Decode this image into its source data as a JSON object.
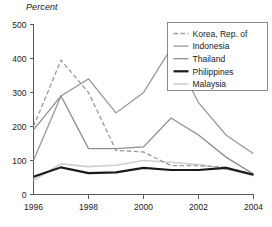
{
  "chart_data": {
    "type": "line",
    "title": "",
    "ylabel": "Percent",
    "xlabel": "",
    "ylim": [
      0,
      500
    ],
    "xlim": [
      1996,
      2004
    ],
    "yticks": [
      0,
      100,
      200,
      300,
      400,
      500
    ],
    "xticks": [
      1996,
      1998,
      2000,
      2002,
      2004
    ],
    "ytick_labels": [
      "0",
      "100",
      "200",
      "300",
      "400",
      "500"
    ],
    "xtick_labels": [
      "1996",
      "1998",
      "2000",
      "2002",
      "2004"
    ],
    "grid": false,
    "legend_position": "top-right",
    "x": [
      1996,
      1997,
      1998,
      1999,
      2000,
      2001,
      2002,
      2003,
      2004
    ],
    "series": [
      {
        "name": "Korea, Rep. of",
        "style": "dashed",
        "color": "#9a9a9a",
        "width": 1.3,
        "values": [
          200,
          395,
          300,
          130,
          125,
          85,
          85,
          80,
          60
        ]
      },
      {
        "name": "Indonesia",
        "style": "solid",
        "color": "#9a9a9a",
        "width": 1.3,
        "values": [
          100,
          290,
          340,
          240,
          300,
          430,
          270,
          175,
          120
        ]
      },
      {
        "name": "Thailand",
        "style": "solid",
        "color": "#8e8e8e",
        "width": 1.3,
        "values": [
          190,
          290,
          135,
          135,
          140,
          225,
          175,
          110,
          60
        ]
      },
      {
        "name": "Philippines",
        "style": "solid",
        "color": "#1a1a1a",
        "width": 2.2,
        "values": [
          52,
          80,
          63,
          65,
          78,
          72,
          72,
          78,
          58
        ]
      },
      {
        "name": "Malaysia",
        "style": "solid",
        "color": "#cfcfcf",
        "width": 1.6,
        "values": [
          42,
          90,
          82,
          86,
          100,
          95,
          88,
          76,
          55
        ]
      }
    ]
  },
  "legend": {
    "entries": [
      {
        "label": "Korea, Rep. of"
      },
      {
        "label": "Indonesia"
      },
      {
        "label": "Thailand"
      },
      {
        "label": "Philippines"
      },
      {
        "label": "Malaysia"
      }
    ]
  },
  "axes": {
    "y_axis_title": "Percent"
  }
}
